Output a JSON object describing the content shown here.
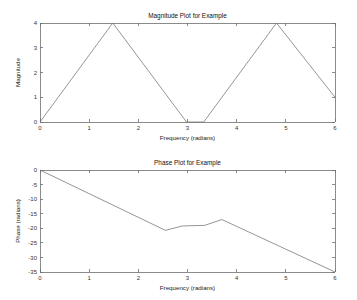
{
  "figure": {
    "background_color": "#ffffff",
    "line_color": "#7a7a7a",
    "axis_color": "#6e6e6e",
    "text_color": "#222222"
  },
  "chart_data": [
    {
      "type": "line",
      "id": "magnitude",
      "title": "Magnitude Plot for Example",
      "xlabel": "Frequency (radians)",
      "ylabel": "Magnitude",
      "xlim": [
        0,
        6
      ],
      "ylim": [
        0,
        4
      ],
      "xticks": [
        0,
        1,
        2,
        3,
        4,
        5,
        6
      ],
      "xticklabels": [
        "0",
        "1",
        "2",
        "3",
        "4",
        "5",
        "6"
      ],
      "yticks": [
        0,
        1,
        2,
        3,
        4
      ],
      "yticklabels": [
        "0",
        "1",
        "2",
        "3",
        "4"
      ],
      "grid": false,
      "legend": null,
      "series": [
        {
          "name": "magnitude",
          "x": [
            0.0,
            1.48,
            2.98,
            3.33,
            4.81,
            6.0
          ],
          "y": [
            0.0,
            4.0,
            0.0,
            0.0,
            4.0,
            1.0
          ]
        }
      ]
    },
    {
      "type": "line",
      "id": "phase",
      "title": "Phase Plot for Example",
      "xlabel": "Frequency (radians)",
      "ylabel": "Phase (radians)",
      "xlim": [
        0,
        6
      ],
      "ylim": [
        -35,
        0
      ],
      "xticks": [
        0,
        1,
        2,
        3,
        4,
        5,
        6
      ],
      "xticklabels": [
        "0",
        "1",
        "2",
        "3",
        "4",
        "5",
        "6"
      ],
      "yticks": [
        -35,
        -30,
        -25,
        -20,
        -15,
        -10,
        -5,
        0
      ],
      "yticklabels": [
        "-35",
        "-30",
        "-25",
        "-20",
        "-15",
        "-10",
        "-5",
        "0"
      ],
      "grid": false,
      "legend": null,
      "series": [
        {
          "name": "phase",
          "x": [
            0.0,
            2.55,
            2.9,
            3.35,
            3.7,
            6.0
          ],
          "y": [
            0.0,
            -20.7,
            -19.2,
            -19.0,
            -17.0,
            -35.0
          ]
        }
      ]
    }
  ]
}
